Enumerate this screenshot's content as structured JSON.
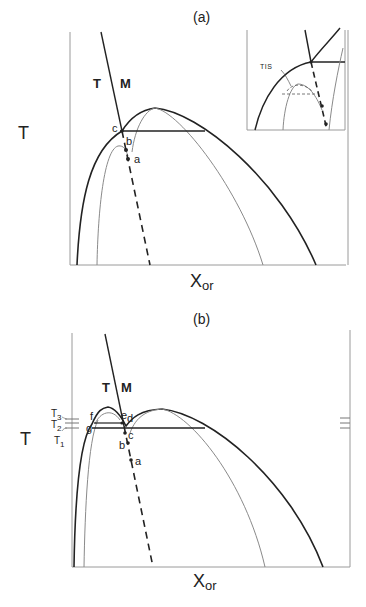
{
  "panels": [
    {
      "id": "a",
      "title": "(a)",
      "y_axis_label": "T",
      "x_axis_label_main": "X",
      "x_axis_label_sub": "or",
      "phase_labels": [
        "T",
        "M"
      ],
      "point_labels": [
        "c",
        "b",
        "a"
      ],
      "inset": {
        "label": "TIS"
      }
    },
    {
      "id": "b",
      "title": "(b)",
      "y_axis_label": "T",
      "x_axis_label_main": "X",
      "x_axis_label_sub": "or",
      "phase_labels": [
        "T",
        "M"
      ],
      "point_labels": [
        "f",
        "g",
        "e",
        "d",
        "c",
        "b",
        "a"
      ],
      "temperature_labels": [
        {
          "main": "T",
          "sub": "3"
        },
        {
          "main": "T",
          "sub": "2"
        },
        {
          "main": "T",
          "sub": "1"
        }
      ]
    }
  ],
  "colors": {
    "heavy_line": "#222222",
    "light_line": "#8a8a8a",
    "axis_line": "#9a9a9a",
    "background": "#ffffff"
  }
}
